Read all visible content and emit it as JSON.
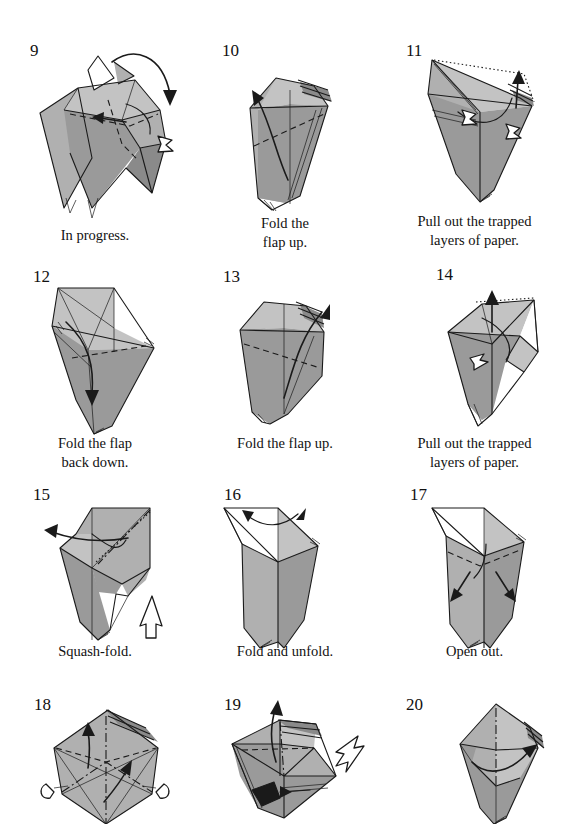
{
  "page": {
    "kind": "origami-instruction-page",
    "width": 569,
    "height": 824,
    "columns": 3,
    "rows": 4,
    "background_color": "#ffffff",
    "ink_color": "#1a1a1a",
    "paper_shades": {
      "light": "#c3c3c3",
      "medium": "#b0b0b0",
      "dark": "#9a9a9a",
      "darker": "#8a8a8a",
      "white_side": "#ffffff",
      "black_side": "#1a1a1a"
    },
    "legend": {
      "valley_fold": "dashed line",
      "mountain_fold": "dash-dot line",
      "hidden_edge": "dotted line",
      "fold_arrow": "solid arrow",
      "push_arrow": "hollow arrow"
    }
  },
  "steps": [
    {
      "number": "9",
      "caption": "In progress.",
      "actions": [
        "fold flap over",
        "pull layer"
      ],
      "arrows": [
        "curved-solid-right",
        "hollow-small"
      ]
    },
    {
      "number": "10",
      "caption": "Fold the\nflap up.",
      "actions": [
        "valley fold flap upward"
      ],
      "arrows": [
        "solid-up-left"
      ]
    },
    {
      "number": "11",
      "caption": "Pull out the trapped\nlayers of paper.",
      "actions": [
        "pull out trapped layers"
      ],
      "arrows": [
        "solid-up",
        "hollow-right",
        "hollow-left"
      ]
    },
    {
      "number": "12",
      "caption": "Fold the flap\nback down.",
      "actions": [
        "fold flap back down"
      ],
      "arrows": [
        "solid-down"
      ]
    },
    {
      "number": "13",
      "caption": "Fold the flap up.",
      "actions": [
        "valley fold flap upward"
      ],
      "arrows": [
        "solid-up-right"
      ]
    },
    {
      "number": "14",
      "caption": "Pull out the trapped\nlayers of paper.",
      "actions": [
        "pull out trapped layers"
      ],
      "arrows": [
        "solid-up",
        "hollow-left"
      ]
    },
    {
      "number": "15",
      "caption": "Squash-fold.",
      "actions": [
        "squash fold"
      ],
      "arrows": [
        "solid-left",
        "hollow-up"
      ]
    },
    {
      "number": "16",
      "caption": "Fold and unfold.",
      "actions": [
        "fold and unfold"
      ],
      "arrows": [
        "fold-unfold-double"
      ]
    },
    {
      "number": "17",
      "caption": "Open out.",
      "actions": [
        "open out both sides"
      ],
      "arrows": [
        "solid-down-left",
        "solid-down-right"
      ]
    },
    {
      "number": "18",
      "caption": "",
      "actions": [
        "valley fold up",
        "mountain fold",
        "rotate edges"
      ],
      "arrows": [
        "solid-up",
        "solid-up-right",
        "hollow-left",
        "hollow-right"
      ]
    },
    {
      "number": "19",
      "caption": "",
      "actions": [
        "fold up",
        "push in"
      ],
      "arrows": [
        "solid-up",
        "hollow-left",
        "solid-right"
      ]
    },
    {
      "number": "20",
      "caption": "",
      "actions": [
        "fold flap across"
      ],
      "arrows": [
        "solid-right"
      ]
    }
  ]
}
